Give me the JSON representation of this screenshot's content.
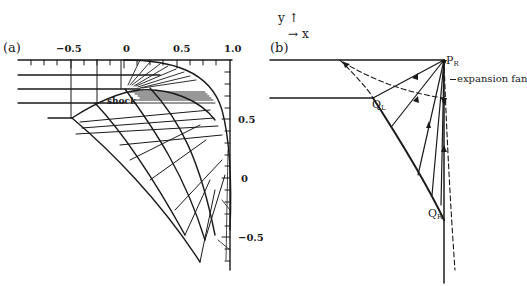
{
  "figure": {
    "axes_legend": {
      "y_label": "y",
      "y_arrow": "↑",
      "x_arrow": "→",
      "x_label": "x"
    },
    "panel_a": {
      "label": "(a)",
      "top_axis_ticks": [
        "−0.5",
        "0",
        "0.5",
        "1.0"
      ],
      "right_axis_ticks": [
        "0.5",
        "0",
        "−0.5"
      ],
      "annotation": "shock"
    },
    "panel_b": {
      "label": "(b)",
      "points": {
        "P": "P",
        "P_sub": "R",
        "QL": "Q",
        "QL_sub": "L",
        "QR": "Q",
        "QR_sub": "R"
      },
      "annotation": "expansion fan"
    },
    "colors": {
      "ink": "#1a1a1a",
      "background": "#ffffff"
    }
  }
}
